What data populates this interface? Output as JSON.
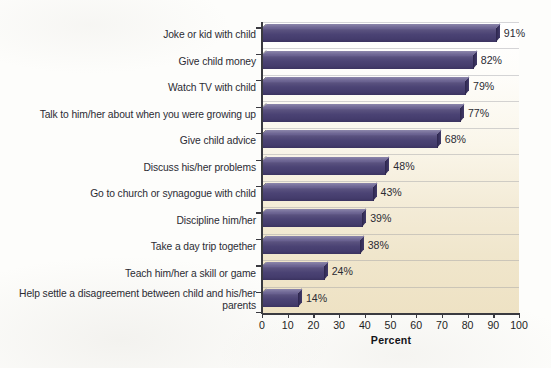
{
  "chart_data": {
    "type": "bar",
    "orientation": "horizontal",
    "title": "",
    "xlabel": "Percent",
    "ylabel": "",
    "xlim": [
      0,
      100
    ],
    "xticks": [
      0,
      10,
      20,
      30,
      40,
      50,
      60,
      70,
      80,
      90,
      100
    ],
    "grid": true,
    "legend": false,
    "categories": [
      "Joke or kid with child",
      "Give child money",
      "Watch TV with child",
      "Talk to him/her about when you were growing up",
      "Give child advice",
      "Discuss his/her problems",
      "Go to church or synagogue with child",
      "Discipline him/her",
      "Take a day trip together",
      "Teach him/her a skill or game",
      "Help settle a disagreement between child and his/her parents"
    ],
    "values": [
      91,
      82,
      79,
      77,
      68,
      48,
      43,
      39,
      38,
      24,
      14
    ],
    "data_labels": [
      "91%",
      "82%",
      "79%",
      "77%",
      "68%",
      "48%",
      "43%",
      "39%",
      "38%",
      "24%",
      "14%"
    ],
    "colors": {
      "bar": "#4b4374",
      "bar_highlight": "#6f6796",
      "bar_shadow": "#2e2750",
      "plot_background_top": "#ffffff",
      "plot_background_bottom": "#eee2c4",
      "axis": "#3a3a40",
      "gridline": "#96969e",
      "text": "#2b2b33"
    }
  },
  "axis_title": "Percent"
}
